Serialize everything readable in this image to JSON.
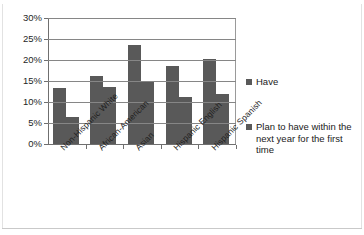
{
  "chart_data": {
    "type": "bar",
    "title": "",
    "subtitle": "",
    "xlabel": "",
    "ylabel": "",
    "ylim": [
      0,
      30
    ],
    "ytick_labels": [
      "0%",
      "5%",
      "10%",
      "15%",
      "20%",
      "25%",
      "30%"
    ],
    "ytick_values": [
      0,
      5,
      10,
      15,
      20,
      25,
      30
    ],
    "grid": true,
    "legend_position": "right",
    "categories": [
      "Non-Hispanic White",
      "African-American",
      "Asian",
      "Hispanic English",
      "Hispanic Spanish"
    ],
    "series": [
      {
        "name": "Have",
        "color": "#595959",
        "values": [
          13.3,
          16.1,
          23.6,
          18.5,
          20.3
        ]
      },
      {
        "name": "Plan to have within the next year for the first time",
        "color": "#595959",
        "values": [
          6.5,
          13.5,
          15.0,
          11.2,
          11.8
        ]
      }
    ]
  },
  "legend": {
    "entries": [
      {
        "label": "Have"
      },
      {
        "label": "Plan to have within the next year for the first time"
      }
    ]
  }
}
